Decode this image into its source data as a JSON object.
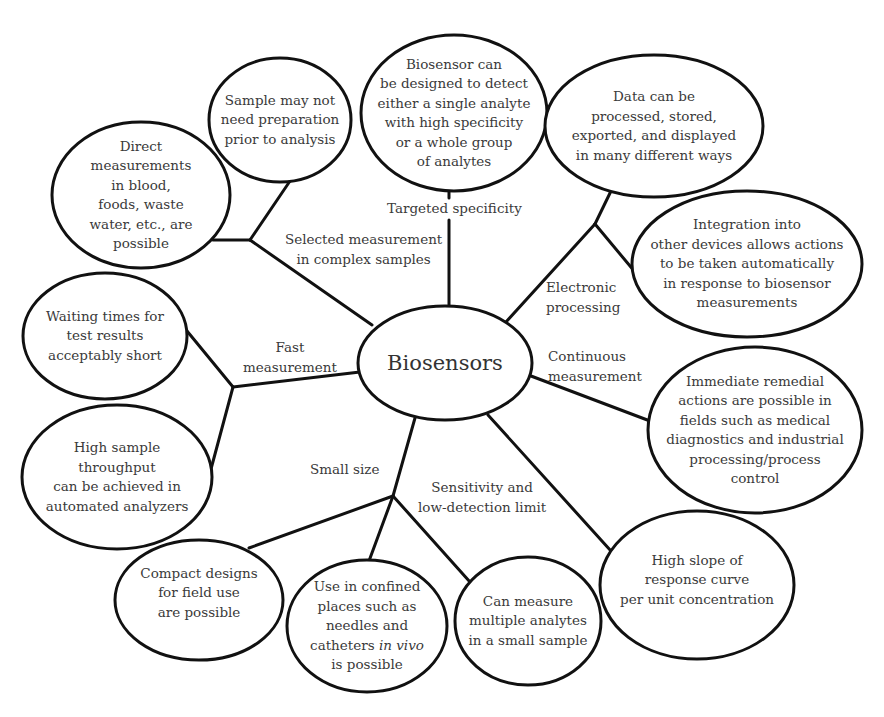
{
  "title": "Biosensors",
  "colors": {
    "stroke": "#111111",
    "text": "#3a3a3a",
    "background": "#ffffff"
  },
  "center": {
    "label": "Biosensors"
  },
  "branches": [
    {
      "id": "selected",
      "label_lines": [
        "Selected measurement",
        "in complex samples"
      ]
    },
    {
      "id": "targeted",
      "label_lines": [
        "Targeted specificity"
      ]
    },
    {
      "id": "electronic",
      "label_lines": [
        "Electronic",
        "processing"
      ]
    },
    {
      "id": "continuous",
      "label_lines": [
        "Continuous",
        "measurement"
      ]
    },
    {
      "id": "fast",
      "label_lines": [
        "Fast",
        "measurement"
      ]
    },
    {
      "id": "small",
      "label_lines": [
        "Small size"
      ]
    },
    {
      "id": "sensitivity",
      "label_lines": [
        "Sensitivity and",
        "low-detection limit"
      ]
    }
  ],
  "nodes": {
    "sample_prep": {
      "lines": [
        "Sample may not",
        "need preparation",
        "prior to analysis"
      ]
    },
    "direct": {
      "lines": [
        "Direct",
        "measurements",
        "in blood,",
        "foods, waste",
        "water, etc., are",
        "possible"
      ]
    },
    "biosensor_can": {
      "lines": [
        "Biosensor can",
        "be designed to detect",
        "either a single analyte",
        "with high specificity",
        "or a whole group",
        "of analytes"
      ]
    },
    "data": {
      "lines": [
        "Data can be",
        "processed, stored,",
        "exported, and displayed",
        "in many different ways"
      ]
    },
    "integration": {
      "lines": [
        "Integration into",
        "other devices allows actions",
        "to be taken automatically",
        "in response to biosensor",
        "measurements"
      ]
    },
    "waiting": {
      "lines": [
        "Waiting times for",
        "test results",
        "acceptably short"
      ]
    },
    "throughput": {
      "lines": [
        "High sample",
        "throughput",
        "can be achieved in",
        "automated analyzers"
      ]
    },
    "immediate": {
      "lines": [
        "Immediate remedial",
        "actions are possible in",
        "fields such as medical",
        "diagnostics and industrial",
        "processing/process",
        "control"
      ]
    },
    "compact": {
      "lines": [
        "Compact designs",
        "for field use",
        "are possible"
      ]
    },
    "confined": {
      "lines": [
        "Use in confined",
        "places such as",
        "needles and"
      ],
      "line4_prefix": "catheters ",
      "line4_italic": "in vivo",
      "line5": "is possible"
    },
    "multiple": {
      "lines": [
        "Can measure",
        "multiple analytes",
        "in a small sample"
      ]
    },
    "slope": {
      "lines": [
        "High slope of",
        "response curve",
        "per unit concentration"
      ]
    }
  }
}
